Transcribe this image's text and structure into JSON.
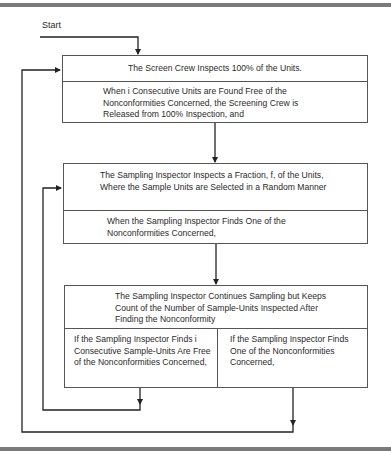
{
  "diagram": {
    "type": "flowchart",
    "start_label": "Start",
    "boxes": [
      {
        "id": "screening",
        "title": "The Screen Crew Inspects 100% of the Units.",
        "condition": "When i Consecutive Units are Found Free of the Nonconformities Concerned, the Screening Crew is Released from 100% Inspection, and"
      },
      {
        "id": "sampling",
        "title": "The Sampling Inspector Inspects a Fraction, f, of the Units, Where the Sample Units are Selected in a Random Manner",
        "condition": "When the Sampling Inspector Finds One of the Nonconformities Concerned,"
      },
      {
        "id": "counting",
        "title": "The Sampling Inspector Continues Sampling but Keeps Count of the Number of Sample-Units Inspected After Finding the Nonconformity",
        "branches": [
          {
            "id": "free",
            "text": "If the Sampling Inspector Finds i Consecutive Sample-Units Are Free of the Nonconformities Concerned,",
            "goes_to": "sampling"
          },
          {
            "id": "found",
            "text": "If the Sampling Inspector Finds One of the Nonconformities Concerned,",
            "goes_to": "screening"
          }
        ]
      }
    ],
    "edges": [
      {
        "from": "start",
        "to": "screening"
      },
      {
        "from": "screening",
        "to": "sampling"
      },
      {
        "from": "sampling",
        "to": "counting"
      },
      {
        "from": "counting.free",
        "to": "sampling"
      },
      {
        "from": "counting.found",
        "to": "screening"
      }
    ]
  }
}
